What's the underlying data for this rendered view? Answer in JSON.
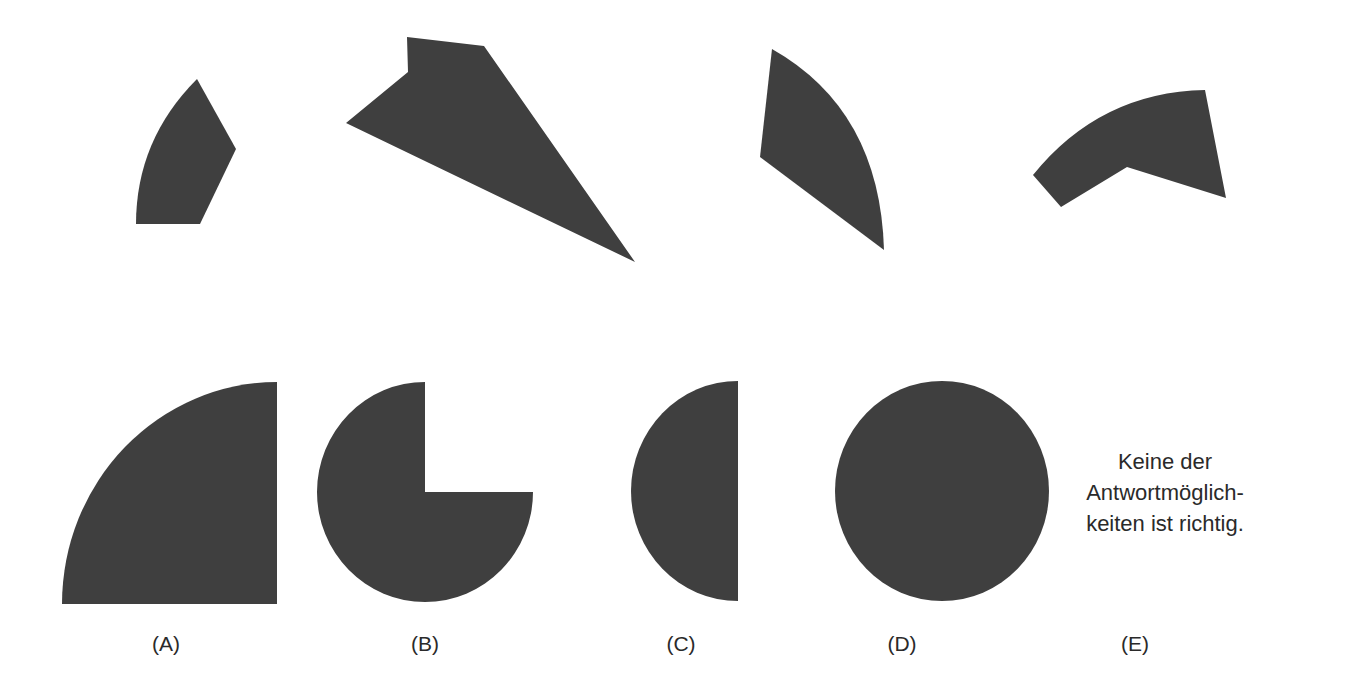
{
  "puzzle": {
    "pieces": [
      {
        "id": "piece-1",
        "description": "curved pentagon fragment"
      },
      {
        "id": "piece-2",
        "description": "large triangular wedge with notch"
      },
      {
        "id": "piece-3",
        "description": "curved sector fragment"
      },
      {
        "id": "piece-4",
        "description": "curved arc band fragment"
      }
    ],
    "shape_color": "#3f3f3f"
  },
  "options": [
    {
      "label": "(A)",
      "shape": "quarter-circle"
    },
    {
      "label": "(B)",
      "shape": "three-quarter-circle"
    },
    {
      "label": "(C)",
      "shape": "half-circle"
    },
    {
      "label": "(D)",
      "shape": "full-circle"
    },
    {
      "label": "(E)",
      "text_lines": [
        "Keine der",
        "Antwortmöglich-",
        "keiten ist richtig."
      ]
    }
  ]
}
